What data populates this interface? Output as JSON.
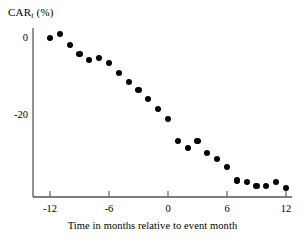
{
  "chart_data": {
    "type": "scatter",
    "title": "",
    "ylabel": "CAR",
    "ylabel_sub": "t",
    "ylabel_units": "(%)",
    "xlabel": "Time in months relative to event month",
    "xlim": [
      -13,
      12.6
    ],
    "ylim": [
      -42,
      3
    ],
    "grid": false,
    "legend": null,
    "xticks": [
      -12,
      -6,
      0,
      6,
      12
    ],
    "xtick_labels": [
      "-12",
      "-6",
      "0",
      "6",
      "12"
    ],
    "yticks": [
      0,
      -20
    ],
    "ytick_labels": [
      "0",
      "-20"
    ],
    "marker": "filled-circle",
    "marker_color": "#000000",
    "x": [
      -12,
      -11,
      -10,
      -9,
      -8,
      -7,
      -6,
      -5,
      -4,
      -3,
      -2,
      -1,
      0,
      1,
      2,
      3,
      4,
      5,
      6,
      7,
      8,
      9,
      10,
      11,
      12
    ],
    "y": [
      0.0,
      1.0,
      -1.8,
      -4.2,
      -5.8,
      -5.2,
      -6.5,
      -9.0,
      -11.5,
      -13.5,
      -15.8,
      -18.5,
      -21.0,
      -26.8,
      -28.5,
      -26.8,
      -29.8,
      -31.5,
      -33.5,
      -37.0,
      -37.5,
      -38.5,
      -38.5,
      -37.5,
      -39.0
    ],
    "series_name": "CAR_t"
  },
  "axis": {
    "ylabel_text": "CAR",
    "ylabel_subscript": "t",
    "ylabel_suffix": " (%)"
  }
}
